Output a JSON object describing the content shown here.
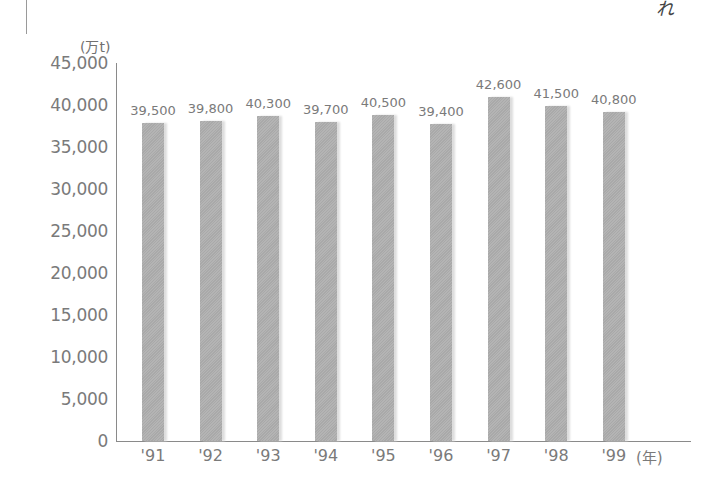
{
  "chart_data": {
    "type": "bar",
    "title": "",
    "xlabel": "(年)",
    "ylabel": "(万t)",
    "categories": [
      "'91",
      "'92",
      "'93",
      "'94",
      "'95",
      "'96",
      "'97",
      "'98",
      "'99"
    ],
    "values": [
      39500,
      39800,
      40300,
      39700,
      40500,
      39400,
      42600,
      41500,
      40800
    ],
    "value_labels": [
      "39,500",
      "39,800",
      "40,300",
      "39,700",
      "40,500",
      "39,400",
      "42,600",
      "41,500",
      "40,800"
    ],
    "ylim": [
      0,
      45000
    ],
    "yticks": [
      0,
      5000,
      10000,
      15000,
      20000,
      25000,
      30000,
      35000,
      40000,
      45000
    ],
    "ytick_labels": [
      "0",
      "5,000",
      "10,000",
      "15,000",
      "20,000",
      "25,000",
      "30,000",
      "35,000",
      "40,000",
      "45,000"
    ],
    "grid": false,
    "legend": null,
    "bar_color": "#b0b0b0"
  },
  "labels": {
    "y_unit": "(万t)",
    "x_unit": "(年)",
    "corner_mark": "れ"
  }
}
